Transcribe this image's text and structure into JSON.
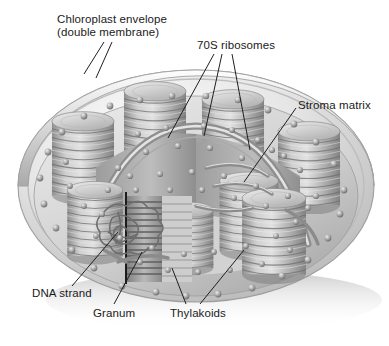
{
  "figure": {
    "style": "grayscale-airbrush-illustration",
    "background": "#ffffff"
  },
  "labels": [
    {
      "name": "chloroplast-envelope",
      "line1": "Chloroplast envelope",
      "line2": "(double membrane)",
      "x": 57,
      "y": 13
    },
    {
      "name": "ribosomes-70s",
      "line1": "70S ribosomes",
      "line2": "",
      "x": 197,
      "y": 39
    },
    {
      "name": "stroma-matrix",
      "line1": "Stroma matrix",
      "line2": "",
      "x": 298,
      "y": 99
    },
    {
      "name": "dna-strand",
      "line1": "DNA strand",
      "line2": "",
      "x": 32,
      "y": 287
    },
    {
      "name": "granum",
      "line1": "Granum",
      "line2": "",
      "x": 93,
      "y": 307
    },
    {
      "name": "thylakoids",
      "line1": "Thylakoids",
      "line2": "",
      "x": 170,
      "y": 307
    }
  ],
  "palette": {
    "outline": "#4a4a4a",
    "leader": "#1f1f1f",
    "envelope_light": "#f2f2f2",
    "envelope_mid": "#d4d4d4",
    "envelope_dark": "#a8a8a8",
    "stroma_light": "#e0e0e0",
    "stroma_mid": "#c4c4c4",
    "stroma_dark": "#9a9a9a",
    "granum_light": "#d8d8d8",
    "granum_mid": "#b0b0b0",
    "granum_dark": "#7e7e7e",
    "ribosome": "#8c8c8c",
    "shadow": "#cfcfcf",
    "text": "#1a1a1a"
  },
  "structures": {
    "grana_stacks": 7,
    "cut_granum_discs": 14,
    "ribosome_count": "many",
    "has_dna_loop": true,
    "has_stroma_lamellae": true,
    "has_cutaway_wedge": true
  }
}
